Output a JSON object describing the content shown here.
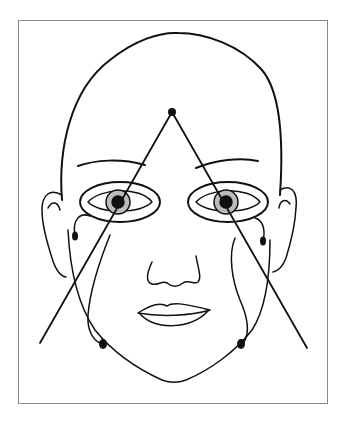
{
  "figure": {
    "line_color": "#111111",
    "frame_color": "#8a8a8a",
    "electrodes": [
      {
        "name": "forehead",
        "x": 172,
        "y": 112
      },
      {
        "name": "right-outer-canthus",
        "x": 75,
        "y": 235
      },
      {
        "name": "left-outer-canthus",
        "x": 263,
        "y": 241
      },
      {
        "name": "right-jaw",
        "x": 103,
        "y": 344
      },
      {
        "name": "left-jaw",
        "x": 241,
        "y": 344
      }
    ],
    "triangle_lines": [
      {
        "from": [
          172,
          112
        ],
        "to": [
          40,
          343
        ]
      },
      {
        "from": [
          172,
          112
        ],
        "to": [
          307,
          348
        ]
      }
    ]
  }
}
